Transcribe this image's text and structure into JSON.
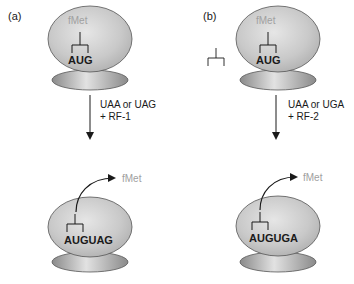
{
  "figure": {
    "panels": [
      {
        "id": "a",
        "label": "(a)",
        "initial": {
          "amino_acid": "fMet",
          "codon": "AUG"
        },
        "transition": {
          "line1": "UAA or UAG",
          "line2": "+ RF-1"
        },
        "final": {
          "released": "fMet",
          "sequence": "AUGUAG"
        }
      },
      {
        "id": "b",
        "label": "(b)",
        "initial": {
          "amino_acid": "fMet",
          "codon": "AUG"
        },
        "transition": {
          "line1": "UAA or UGA",
          "line2": "+ RF-2"
        },
        "final": {
          "released": "fMet",
          "sequence": "AUGUGA"
        }
      }
    ],
    "colors": {
      "ribosome_large": "#c9c9c9",
      "ribosome_outline": "#555555",
      "ribosome_small_edge": "#8a8a8a",
      "ribosome_small_center": "#e2e2e2",
      "fmet_text": "#a0a0a0",
      "text": "#1a1a1a"
    }
  }
}
